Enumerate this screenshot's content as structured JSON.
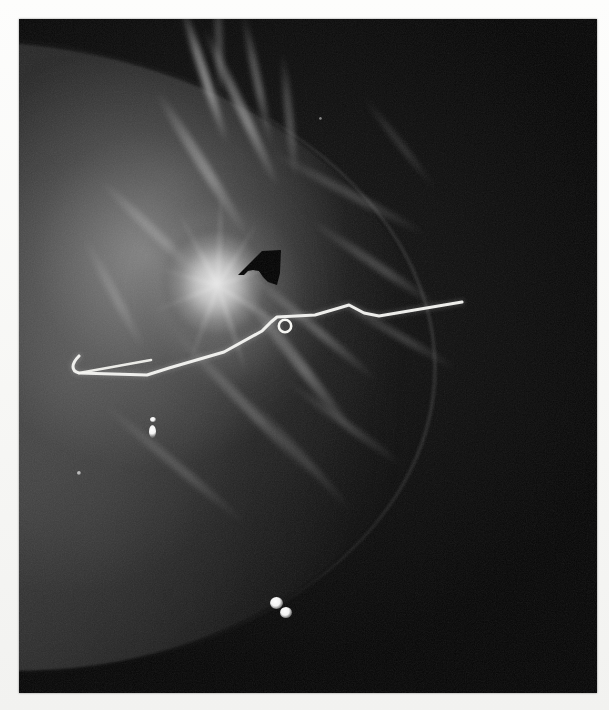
{
  "figure": {
    "modality": "mammogram",
    "caption_text": "",
    "border_color": "#fbfbfa",
    "plate_background": "#050505"
  },
  "plate": {
    "x": 19,
    "y": 19,
    "width": 578,
    "height": 674
  },
  "annotations": {
    "arrow": {
      "name": "black-arrow-marker",
      "color": "#000000",
      "tip_x": 238,
      "tip_y": 268,
      "points_to": "spiculated-mass",
      "direction": "up-left"
    },
    "wire": {
      "name": "localization-wire",
      "color": "#f2f2ee",
      "description": "hook-wire running from inferior-left hook to lateral right exit",
      "path": "M 60 337 C 52 345, 52 352, 60 354 L 128 356 L 150 349 L 205 333 L 243 312 L 252 303 L 258 298 L 296 296 L 320 289 L 330 286 L 345 294 L 360 297 L 443 283",
      "hook_path": "M 60 354 L 132 341",
      "bead": {
        "cx": 266,
        "cy": 306,
        "r": 6
      }
    }
  },
  "findings": {
    "mass": {
      "name": "spiculated-mass",
      "center_x": 199,
      "center_y": 264,
      "width": 116,
      "height": 128,
      "brightness": "high"
    },
    "calcifications": [
      {
        "name": "calcification-upper",
        "x": 152,
        "y": 432,
        "w": 7,
        "h": 12
      },
      {
        "name": "calcification-lower-a",
        "x": 277,
        "y": 604,
        "w": 11,
        "h": 10
      },
      {
        "name": "calcification-lower-b",
        "x": 286,
        "y": 614,
        "w": 10,
        "h": 9
      }
    ]
  },
  "chart_data": {
    "type": "scatter",
    "title": "",
    "xlabel": "",
    "ylabel": "",
    "series": [
      {
        "name": "radiopaque-markers",
        "points": [
          {
            "x": 152,
            "y": 432
          },
          {
            "x": 277,
            "y": 604
          },
          {
            "x": 286,
            "y": 614
          }
        ]
      }
    ]
  }
}
